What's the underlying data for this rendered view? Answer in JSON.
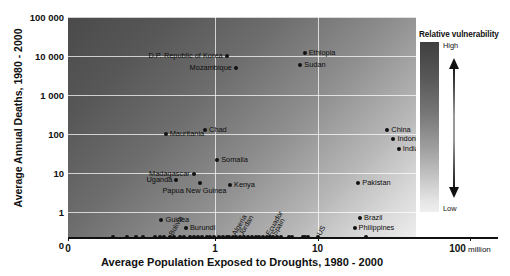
{
  "chart_data": {
    "type": "scatter",
    "title": "",
    "xlabel": "Average Population Exposed to Droughts, 1980 - 2000",
    "ylabel": "Average Annual Deaths, 1980 - 2000",
    "xscale": "log",
    "yscale": "log",
    "xticks": [
      "0",
      "1",
      "10",
      "100"
    ],
    "x_unit_suffix": "million",
    "yticks": [
      "100 000",
      "10 000",
      "1 000",
      "100",
      "10",
      "1",
      "0"
    ],
    "grid": true,
    "background_note": "diagonal grey gradient, dark = high relative vulnerability",
    "points": [
      {
        "label": "D.P. Republic of Korea",
        "x": 1.3,
        "y": 10000,
        "label_side": "left"
      },
      {
        "label": "Ethiopia",
        "x": 7.5,
        "y": 12000,
        "label_side": "right"
      },
      {
        "label": "Mozambique",
        "x": 1.6,
        "y": 5000,
        "label_side": "left"
      },
      {
        "label": "Sudan",
        "x": 6.8,
        "y": 6000,
        "label_side": "right"
      },
      {
        "label": "Mauritania",
        "x": 0.33,
        "y": 100,
        "label_side": "right"
      },
      {
        "label": "Chad",
        "x": 0.8,
        "y": 130,
        "label_side": "right"
      },
      {
        "label": "China",
        "x": 48,
        "y": 130,
        "label_side": "right"
      },
      {
        "label": "Indonesia",
        "x": 55,
        "y": 75,
        "label_side": "right"
      },
      {
        "label": "India",
        "x": 62,
        "y": 42,
        "label_side": "right"
      },
      {
        "label": "Somalia",
        "x": 1.05,
        "y": 22,
        "label_side": "right"
      },
      {
        "label": "Madagascar",
        "x": 0.62,
        "y": 9.5,
        "label_side": "left"
      },
      {
        "label": "Uganda",
        "x": 0.42,
        "y": 6.5,
        "label_side": "left"
      },
      {
        "label": "Papua New Guinea",
        "x": 0.72,
        "y": 5.5,
        "label_side": "below"
      },
      {
        "label": "Kenya",
        "x": 1.4,
        "y": 4.8,
        "label_side": "right"
      },
      {
        "label": "Pakistan",
        "x": 25,
        "y": 5.5,
        "label_side": "right"
      },
      {
        "label": "Guinea",
        "x": 0.3,
        "y": 0.62,
        "label_side": "right"
      },
      {
        "label": "Burundi",
        "x": 0.52,
        "y": 0.38,
        "label_side": "right"
      },
      {
        "label": "Brazil",
        "x": 26,
        "y": 0.7,
        "label_side": "right"
      },
      {
        "label": "Philippines",
        "x": 23,
        "y": 0.4,
        "label_side": "right"
      }
    ],
    "zero_axis_points": [
      {
        "label": "Bolivia",
        "x": 0.36
      },
      {
        "label": "Algeria",
        "x": 1.5
      },
      {
        "label": "Jordan",
        "x": 1.75
      },
      {
        "label": "Ecuador",
        "x": 3.2
      },
      {
        "label": "Spain",
        "x": 3.7
      },
      {
        "label": "US",
        "x": 10.0
      }
    ],
    "zero_axis_unlabeled_x": [
      0.1,
      0.14,
      0.17,
      0.2,
      0.26,
      0.29,
      0.32,
      0.4,
      0.46,
      0.5,
      0.57,
      0.62,
      0.68,
      0.75,
      0.83,
      0.9,
      0.97,
      1.1,
      1.2,
      1.3,
      1.38,
      1.6,
      1.9,
      2.1,
      2.3,
      2.5,
      2.7,
      2.95,
      3.45,
      4.0,
      4.4,
      5.3,
      5.7,
      7.2,
      7.6,
      8.0,
      30.0
    ]
  },
  "legend": {
    "title": "Relative vulnerability",
    "high_label": "High",
    "low_label": "Low",
    "arrow_name": "double-headed-vertical-arrow"
  }
}
